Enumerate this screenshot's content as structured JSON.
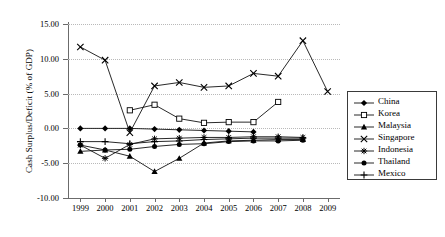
{
  "chart_data": {
    "type": "line",
    "title": "",
    "xlabel": "",
    "ylabel": "Cash Surplus/Deficit (% of GDP)",
    "categories": [
      "1999",
      "2000",
      "2001",
      "2002",
      "2003",
      "2004",
      "2005",
      "2006",
      "2007",
      "2008",
      "2009"
    ],
    "x": [
      1999,
      2000,
      2001,
      2002,
      2003,
      2004,
      2005,
      2006,
      2007,
      2008,
      2009
    ],
    "ylim": [
      -10.0,
      15.0
    ],
    "yticks": [
      15.0,
      10.0,
      5.0,
      0.0,
      -5.0,
      -10.0
    ],
    "ytick_labels": [
      "15.00",
      "10.00",
      "5.00",
      "0.00",
      "-5.00",
      "-10.00"
    ],
    "grid": true,
    "legend_position": "right",
    "series": [
      {
        "name": "China",
        "marker": "filled-diamond",
        "values": [
          0.0,
          0.0,
          0.0,
          -0.1,
          -0.2,
          -0.3,
          -0.4,
          -0.5,
          null,
          null,
          null
        ]
      },
      {
        "name": "Korea",
        "marker": "open-square",
        "values": [
          null,
          null,
          2.6,
          3.4,
          1.4,
          0.8,
          0.9,
          0.9,
          3.8,
          null,
          null
        ]
      },
      {
        "name": "Malaysia",
        "marker": "filled-triangle",
        "values": [
          -3.3,
          -3.1,
          -4.0,
          -6.2,
          -4.3,
          -2.1,
          -1.8,
          -1.7,
          -1.6,
          -1.6,
          null
        ]
      },
      {
        "name": "Singapore",
        "marker": "x-cross",
        "values": [
          11.7,
          9.8,
          -0.6,
          6.1,
          6.6,
          5.9,
          6.1,
          7.9,
          7.5,
          12.6,
          5.3
        ]
      },
      {
        "name": "Indonesia",
        "marker": "star-asterisk",
        "values": [
          -2.4,
          -4.3,
          -2.3,
          -1.5,
          -1.4,
          -1.3,
          -1.3,
          -1.2,
          -1.2,
          -1.3,
          null
        ]
      },
      {
        "name": "Thailand",
        "marker": "filled-circle",
        "values": [
          -2.4,
          -3.1,
          -3.0,
          -2.6,
          -2.3,
          -2.2,
          -1.9,
          -1.8,
          -1.8,
          -1.7,
          null
        ]
      },
      {
        "name": "Mexico",
        "marker": "plus-cross",
        "values": [
          -1.9,
          -1.9,
          -2.2,
          -1.9,
          -1.8,
          -1.6,
          -1.5,
          -1.4,
          -1.4,
          -1.4,
          null
        ]
      }
    ]
  },
  "legend": {
    "items": [
      {
        "label": "China"
      },
      {
        "label": "Korea"
      },
      {
        "label": "Malaysia"
      },
      {
        "label": "Singapore"
      },
      {
        "label": "Indonesia"
      },
      {
        "label": "Thailand"
      },
      {
        "label": "Mexico"
      }
    ]
  }
}
